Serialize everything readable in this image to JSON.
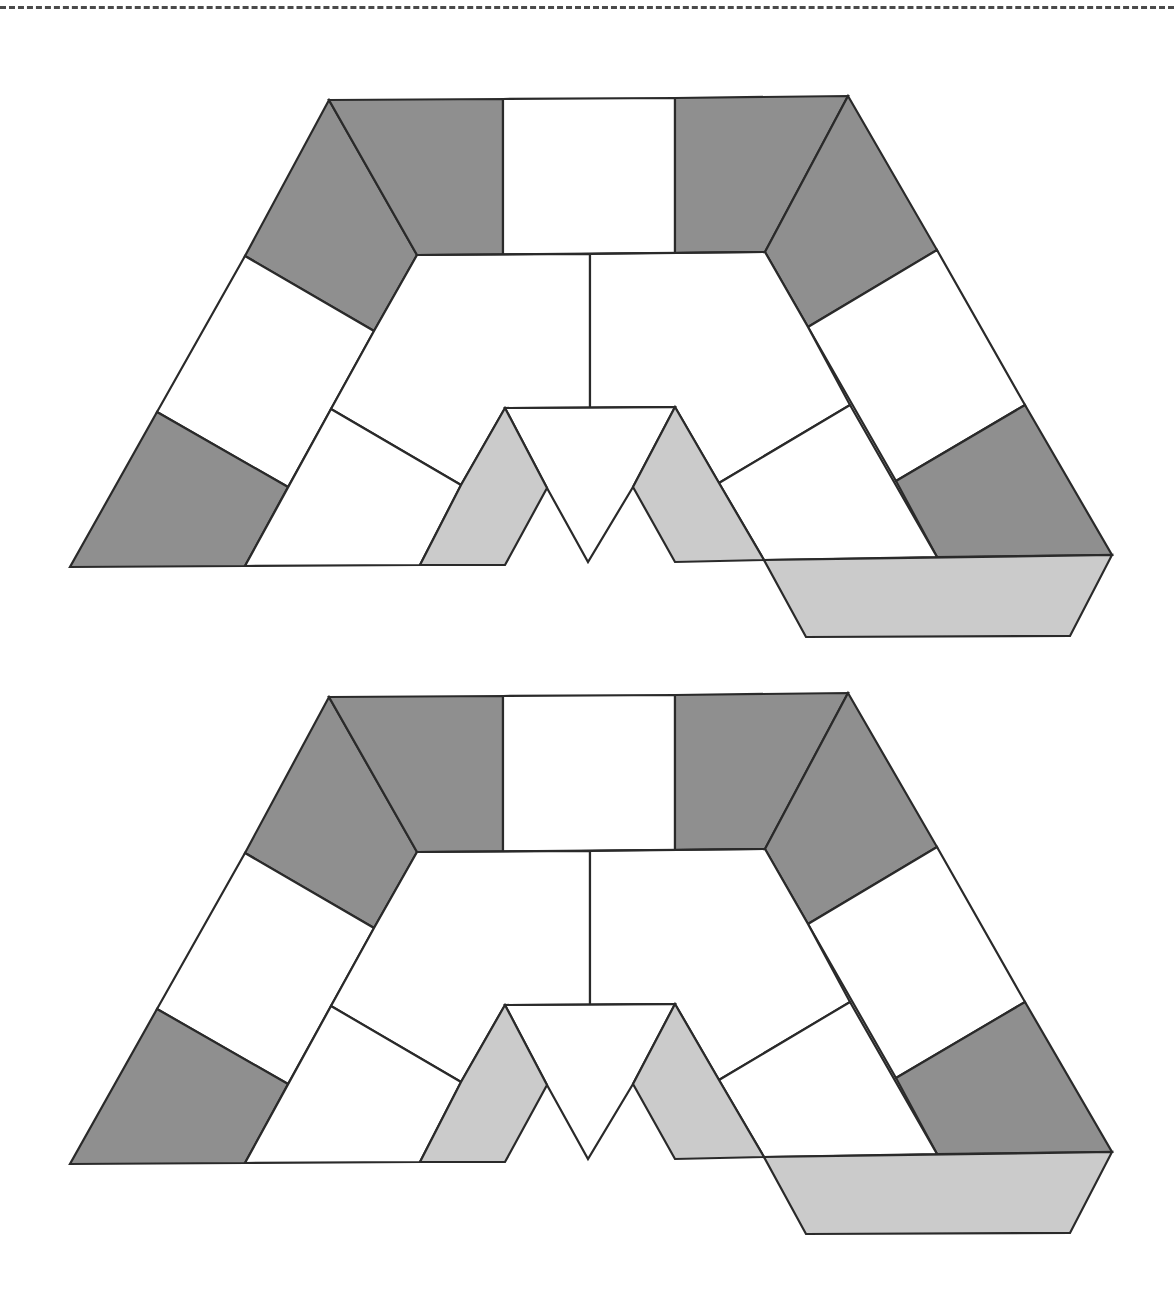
{
  "page": {
    "width": 1174,
    "height": 1289
  },
  "cut_line": {
    "style": "dashed",
    "y": 7,
    "color": "#4a4a4a"
  },
  "colors": {
    "dark": "#8f8f8f",
    "light": "#cbcbcb",
    "white": "#ffffff",
    "stroke": "#2a2a2a"
  },
  "board_game_path": {
    "copies": [
      {
        "name": "top-copy",
        "dy": 0
      },
      {
        "name": "bottom-copy",
        "dy": 597
      }
    ],
    "pieces": [
      {
        "name": "left-arm-top-dark",
        "fill": "dark",
        "points": [
          [
            329,
            100
          ],
          [
            417,
            255
          ],
          [
            374,
            331
          ],
          [
            245,
            256
          ]
        ]
      },
      {
        "name": "left-arm-upper-white",
        "fill": "white",
        "points": [
          [
            245,
            256
          ],
          [
            374,
            331
          ],
          [
            288,
            487
          ],
          [
            157,
            412
          ]
        ]
      },
      {
        "name": "left-arm-bottom-dark",
        "fill": "dark",
        "points": [
          [
            157,
            412
          ],
          [
            288,
            487
          ],
          [
            245,
            566
          ],
          [
            70,
            567
          ]
        ]
      },
      {
        "name": "top-left-dark",
        "fill": "dark",
        "points": [
          [
            329,
            100
          ],
          [
            503,
            99
          ],
          [
            503,
            255
          ],
          [
            417,
            255
          ]
        ]
      },
      {
        "name": "top-center-white",
        "fill": "white",
        "points": [
          [
            503,
            99
          ],
          [
            675,
            98
          ],
          [
            675,
            253
          ],
          [
            503,
            255
          ]
        ]
      },
      {
        "name": "top-right-dark",
        "fill": "dark",
        "points": [
          [
            675,
            98
          ],
          [
            848,
            96
          ],
          [
            765,
            252
          ],
          [
            675,
            253
          ]
        ]
      },
      {
        "name": "right-arm-top-dark",
        "fill": "dark",
        "points": [
          [
            848,
            96
          ],
          [
            937,
            250
          ],
          [
            808,
            327
          ],
          [
            765,
            252
          ]
        ]
      },
      {
        "name": "right-arm-upper-white",
        "fill": "white",
        "points": [
          [
            937,
            250
          ],
          [
            1025,
            405
          ],
          [
            896,
            481
          ],
          [
            808,
            327
          ]
        ]
      },
      {
        "name": "right-arm-bottom-dark",
        "fill": "dark",
        "points": [
          [
            1025,
            405
          ],
          [
            1112,
            555
          ],
          [
            937,
            557
          ],
          [
            896,
            481
          ]
        ]
      },
      {
        "name": "inner-left-upper-white",
        "fill": "white",
        "points": [
          [
            417,
            255
          ],
          [
            590,
            254
          ],
          [
            590,
            408
          ],
          [
            505,
            408
          ],
          [
            461,
            485
          ],
          [
            331,
            409
          ],
          [
            374,
            331
          ]
        ]
      },
      {
        "name": "inner-left-lower-white",
        "fill": "white",
        "points": [
          [
            331,
            409
          ],
          [
            461,
            485
          ],
          [
            420,
            565
          ],
          [
            245,
            566
          ]
        ]
      },
      {
        "name": "inner-right-upper-white",
        "fill": "white",
        "points": [
          [
            590,
            254
          ],
          [
            765,
            252
          ],
          [
            808,
            327
          ],
          [
            850,
            405
          ],
          [
            719,
            483
          ],
          [
            675,
            407
          ],
          [
            590,
            408
          ]
        ]
      },
      {
        "name": "inner-right-lower-white",
        "fill": "white",
        "points": [
          [
            850,
            405
          ],
          [
            937,
            557
          ],
          [
            764,
            560
          ],
          [
            719,
            483
          ]
        ]
      },
      {
        "name": "center-triangle-white",
        "fill": "white",
        "points": [
          [
            505,
            408
          ],
          [
            675,
            407
          ],
          [
            633,
            487
          ],
          [
            588,
            562
          ],
          [
            547,
            488
          ]
        ]
      },
      {
        "name": "left-light-parallelogram",
        "fill": "light",
        "points": [
          [
            505,
            408
          ],
          [
            547,
            488
          ],
          [
            505,
            565
          ],
          [
            420,
            565
          ],
          [
            461,
            485
          ]
        ]
      },
      {
        "name": "right-light-parallelogram",
        "fill": "light",
        "points": [
          [
            675,
            407
          ],
          [
            719,
            483
          ],
          [
            764,
            560
          ],
          [
            675,
            562
          ],
          [
            633,
            487
          ]
        ]
      },
      {
        "name": "bottom-light-strip",
        "fill": "light",
        "points": [
          [
            764,
            560
          ],
          [
            1112,
            555
          ],
          [
            1070,
            636
          ],
          [
            806,
            637
          ]
        ]
      }
    ],
    "lines": [
      {
        "name": "inner-top-vertical-divider",
        "from": [
          590,
          254
        ],
        "to": [
          590,
          408
        ]
      },
      {
        "name": "inner-top-horizontal-edge",
        "from": [
          417,
          255
        ],
        "to": [
          765,
          252
        ]
      },
      {
        "name": "center-top-edge",
        "from": [
          505,
          408
        ],
        "to": [
          675,
          407
        ]
      }
    ]
  }
}
